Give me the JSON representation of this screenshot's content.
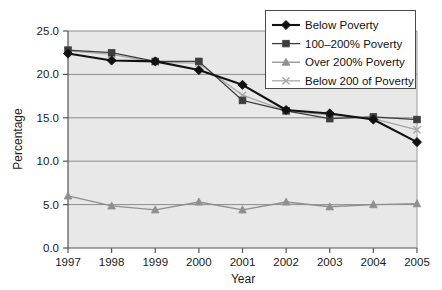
{
  "chart_data": {
    "type": "line",
    "title": "",
    "xlabel": "Year",
    "ylabel": "Percentage",
    "categories": [
      "1997",
      "1998",
      "1999",
      "2000",
      "2001",
      "2002",
      "2003",
      "2004",
      "2005"
    ],
    "x": [
      1997,
      1998,
      1999,
      2000,
      2001,
      2002,
      2003,
      2004,
      2005
    ],
    "xlim": [
      1997,
      2005
    ],
    "ylim": [
      0.0,
      25.0
    ],
    "yticks": [
      "0.0",
      "5.0",
      "10.0",
      "15.0",
      "20.0",
      "25.0"
    ],
    "ytick_values": [
      0.0,
      5.0,
      10.0,
      15.0,
      20.0,
      25.0
    ],
    "grid": true,
    "grid_axis": "y",
    "legend_position": "top-right",
    "series": [
      {
        "name": "Below Poverty",
        "marker": "diamond",
        "color": "#111111",
        "values": [
          22.4,
          21.6,
          21.5,
          20.5,
          18.8,
          15.9,
          15.5,
          14.8,
          12.2
        ]
      },
      {
        "name": "100–200% Poverty",
        "marker": "square",
        "color": "#3d3d3d",
        "values": [
          22.8,
          22.5,
          21.5,
          21.5,
          17.0,
          15.8,
          14.9,
          15.1,
          14.8
        ]
      },
      {
        "name": "Over 200% Poverty",
        "marker": "triangle",
        "color": "#8f8f8f",
        "values": [
          6.0,
          4.85,
          4.4,
          5.3,
          4.4,
          5.3,
          4.75,
          5.0,
          5.1
        ]
      },
      {
        "name": "Below 200 of Poverty",
        "marker": "cross",
        "color": "#a8a8a8",
        "values": [
          22.7,
          22.3,
          21.4,
          21.3,
          17.6,
          15.8,
          15.3,
          14.9,
          13.6
        ]
      }
    ]
  },
  "axes": {
    "y_title": "Percentage",
    "x_title": "Year"
  },
  "legend": {
    "items": [
      {
        "label": "Below Poverty"
      },
      {
        "label": "100–200% Poverty"
      },
      {
        "label": "Over 200% Poverty"
      },
      {
        "label": "Below 200 of Poverty"
      }
    ]
  },
  "colors": {
    "plot_background": "#e8e8e8",
    "gridline": "#8c8c8c",
    "axis": "#555555",
    "legend_border": "#4a4a4a",
    "legend_background": "#ffffff"
  }
}
